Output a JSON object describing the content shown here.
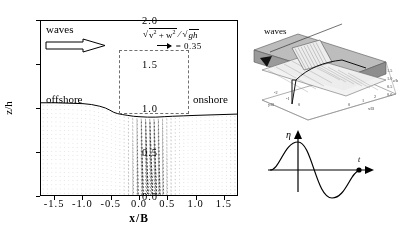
{
  "figure": {
    "domain_type": "scientific-vector-field-figure"
  },
  "main_plot": {
    "xlabel": "x/B",
    "ylabel": "z/h",
    "xticks": [
      "-1.5",
      "-1.0",
      "-0.5",
      "0.0",
      "0.5",
      "1.0",
      "1.5"
    ],
    "xtick_values": [
      -1.5,
      -1.0,
      -0.5,
      0.0,
      0.5,
      1.0,
      1.5
    ],
    "yticks": [
      "0.0",
      "0.5",
      "1.0",
      "1.5",
      "2.0"
    ],
    "ytick_values": [
      0.0,
      0.5,
      1.0,
      1.5,
      2.0
    ],
    "xlim": [
      -1.75,
      1.75
    ],
    "ylim": [
      0.0,
      2.0
    ],
    "annotations": {
      "waves": "waves",
      "offshore": "offshore",
      "onshore": "onshore"
    },
    "legend": {
      "numerator_prefix": "v",
      "numerator_suffix": "w",
      "exponent": "2",
      "plus": "+",
      "denominator": "gh",
      "scale_equals": "=",
      "scale_value": "0.35",
      "full_text": "sqrt(v^2 + w^2) / sqrt(gh)  arrow = 0.35"
    },
    "roi_box": {
      "x_range": [
        -0.5,
        0.5
      ],
      "z_range": [
        0.78,
        1.5
      ]
    }
  },
  "inset_3d": {
    "waves_label": "waves",
    "axis_labels": {
      "x": "x/B",
      "y": "y/B",
      "z": "z/h"
    },
    "z_ticks": [
      "1.5",
      "1.0",
      "0.5",
      "0.0"
    ],
    "x_ticks": [
      "-1",
      "0",
      "1",
      "2"
    ],
    "y_ticks": [
      "-2",
      "-1",
      "0",
      "1"
    ]
  },
  "eta_sketch": {
    "yaxis_label": "η",
    "xaxis_label": "t",
    "phase_marker_present": true
  },
  "chart_data": {
    "type": "scatter",
    "title": "",
    "xlabel": "x/B",
    "ylabel": "z/h",
    "xlim": [
      -1.75,
      1.75
    ],
    "ylim": [
      0.0,
      2.0
    ],
    "grid": false,
    "legend_position": "top-right",
    "series": [
      {
        "name": "free-surface profile",
        "x": [
          -1.75,
          -1.5,
          -1.25,
          -1.0,
          -0.85,
          -0.7,
          -0.6,
          -0.52,
          -0.45,
          -0.38,
          -0.3,
          -0.2,
          -0.1,
          0.0,
          0.15,
          0.3,
          0.45,
          0.6,
          0.8,
          1.0,
          1.25,
          1.5,
          1.75
        ],
        "y": [
          1.06,
          1.06,
          1.055,
          1.05,
          1.04,
          1.02,
          1.0,
          0.975,
          0.95,
          0.935,
          0.925,
          0.915,
          0.905,
          0.9,
          0.895,
          0.895,
          0.9,
          0.905,
          0.91,
          0.915,
          0.92,
          0.925,
          0.93
        ]
      },
      {
        "name": "bed profile",
        "x": [
          -1.75,
          -0.6,
          -0.55,
          0.55,
          0.6,
          1.75
        ],
        "y": [
          0.0,
          0.0,
          0.0,
          0.0,
          0.0,
          0.0
        ]
      }
    ],
    "vector_field": {
      "quantity": "sqrt(v^2 + w^2)/sqrt(gh)",
      "reference_arrow_value": 0.35,
      "grid_nx": 46,
      "grid_nz": 22,
      "description": "Downward-and-onshore directed velocity vectors beneath a breaking wave front; strongest magnitudes concentrated in a plume near x/B = 0 to 0.6 extending from the surface to the bed."
    }
  }
}
